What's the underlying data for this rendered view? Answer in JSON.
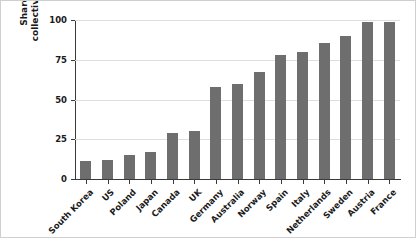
{
  "chart_data": {
    "type": "bar",
    "title": "",
    "subtitle": "",
    "xlabel": "",
    "ylabel": "Share of employees covered by collective bargaining agreements (%)",
    "ylabel_lines": [
      "Share of employees covered by",
      "collective bargaining agreements (%)"
    ],
    "categories": [
      "South Korea",
      "US",
      "Poland",
      "Japan",
      "Canada",
      "UK",
      "Germany",
      "Australia",
      "Norway",
      "Spain",
      "Italy",
      "Netherlands",
      "Sweden",
      "Austria",
      "France"
    ],
    "values": [
      11.5,
      12,
      15,
      17,
      29,
      30,
      58,
      60,
      67,
      78,
      80,
      85.5,
      90,
      99,
      99
    ],
    "ylim": [
      0,
      100
    ],
    "yticks": [
      0,
      25,
      50,
      75,
      100
    ],
    "ytick_labels": [
      "0",
      "25",
      "50",
      "75",
      "100"
    ],
    "grid": true,
    "grid_axis": "y",
    "legend": false,
    "legend_position": "none",
    "bar_color": "#6e6e6e",
    "grid_color": "#dedede",
    "axis_color": "#3a3a3a",
    "background_color": "#ffffff",
    "series": [
      {
        "name": "Collective bargaining coverage",
        "values": [
          11.5,
          12,
          15,
          17,
          29,
          30,
          58,
          60,
          67,
          78,
          80,
          85.5,
          90,
          99,
          99
        ]
      }
    ]
  }
}
